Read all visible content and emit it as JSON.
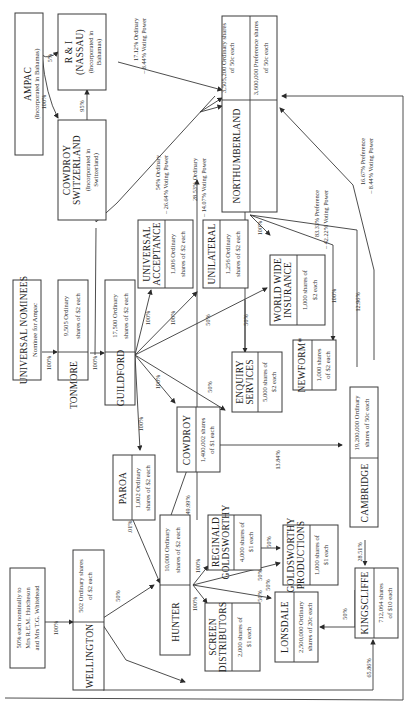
{
  "diagram": {
    "orientation": "rotated 90deg counter-clockwise (text reads bottom-to-top)",
    "entities": {
      "ampac": {
        "name": "AMPAC",
        "note": "(Incorporated in Bahamas)"
      },
      "ri_nassau": {
        "name": "R & I",
        "name2": "(NASSAU)",
        "note": "(Incorporated in",
        "note2": "Bahamas)"
      },
      "cowdroy_switzerland": {
        "name": "COWDROY",
        "name2": "SWITZERLAND",
        "note": "(Incorporated in",
        "note2": "Switzerland)"
      },
      "universal_nominees": {
        "name": "UNIVERSAL NOMINEES",
        "note": "Nominee for Ampac"
      },
      "tonmore": {
        "name": "TONMORE",
        "shares": "9,505 Ordinary",
        "shares2": "shares of $2 each"
      },
      "guildford": {
        "name": "GUILDFORD",
        "shares": "17,500 Ordinary",
        "shares2": "shares of $2 each"
      },
      "universal_acceptance": {
        "name": "UNIVERSAL",
        "name2": "ACCEPTANCE",
        "shares": "1,006 Ordinary",
        "shares2": "shares of $2 each"
      },
      "unilateral": {
        "name": "UNILATERAL",
        "shares": "1,256 Ordinary",
        "shares2": "shares of $2 each"
      },
      "northumberland": {
        "name": "NORTHUMBERLAND",
        "shares_ordinary": "3,505,200 Ordinary shares",
        "shares_ordinary2": "of 50c each",
        "shares_pref": "3,600,000 Preference shares",
        "shares_pref2": "of 50c each"
      },
      "world_wide_insurance": {
        "name": "WORLD WIDE",
        "name2": "INSURANCE",
        "shares": "1,000 shares of",
        "shares2": "$2 each"
      },
      "enquiry_services": {
        "name": "ENQUIRY",
        "name2": "SERVICES",
        "shares": "5,000 shares of",
        "shares2": "$2 each"
      },
      "newform": {
        "name": "NEWFORM*",
        "shares": "1,000 shares",
        "shares2": "of $2 each"
      },
      "cowdroy": {
        "name": "COWDROY",
        "shares": "1,400,002 shares",
        "shares2": "of $1 each"
      },
      "paroa": {
        "name": "PAROA",
        "shares": "1,002 Ordinary",
        "shares2": "shares of $2 each"
      },
      "cambridge": {
        "name": "CAMBRIDGE",
        "shares": "19,200,000 Ordinary",
        "shares2": "shares of 50c each"
      },
      "reginald_goldsworthy": {
        "name": "REGINALD",
        "name2": "GOLDSWORTHY",
        "shares": "4,000 shares of",
        "shares2": "$1 each"
      },
      "goldsworthy_productions": {
        "name": "GOLDSWORTHY",
        "name2": "PRODUCTIONS",
        "shares": "1,000 shares of",
        "shares2": "$1 each"
      },
      "hunter": {
        "name": "HUNTER",
        "shares": "10,000 Ordinary",
        "shares2": "shares of $2 each"
      },
      "screen_distributors": {
        "name": "SCREEN",
        "name2": "DISTRIBUTORS",
        "shares": "2,000 shares of",
        "shares2": "$1 each"
      },
      "lonsdale": {
        "name": "LONSDALE",
        "shares": "2,500,000 Ordinary",
        "shares2": "shares of 20c each"
      },
      "kingscliffe": {
        "name": "KINGSCLIFFE",
        "shares": "712,064 shares",
        "shares2": "of $10 each"
      },
      "wellington": {
        "name": "WELLINGTON",
        "shares": "502 Ordinary shares",
        "shares2": "of $2 each"
      },
      "owners": {
        "line1": "50% each nominally to",
        "line2": "Mrs R.E.M. Hutcheson",
        "line3": "and Mrs T.G. Whitehead"
      }
    },
    "relations": {
      "ampac_ri": "5%",
      "ampac_cowdroy_sw": "100%",
      "cowdroy_sw_ri": "95%",
      "ri_north_1": "17.12% Ordinary",
      "ri_north_2": "– 8.44% Voting Power",
      "cowdroy_sw_north_1": "54% Ordinary",
      "cowdroy_sw_north_2": "– 26.64% Voting Power",
      "unilateral_north_1": "28.53% Ordinary",
      "unilateral_north_2": "– 14.07% Voting Power",
      "cambridge_north_pref_1": "83.33% Preference",
      "cambridge_north_pref_2": "– 42.22% Voting Power",
      "kingscliffe_north_pref_1": "16.67% Preference",
      "kingscliffe_north_pref_2": "– 8.44% Voting Power",
      "universal_tonmore": "100%",
      "tonmore_guildford": "100%",
      "guildford_ua": "100%",
      "guildford_unilateral": "100%",
      "guildford_wwi": "50%",
      "guildford_enquiry": "50%",
      "guildford_cowdroy": "100%",
      "guildford_paroa": "100%",
      "unilateral_enquiry": "50%",
      "north_wwi": "100%",
      "north_newform": "100%",
      "north_cambridge": "12.96%",
      "cowdroy_cambridge": "13.84%",
      "cowdroy_hunter": "49.99%",
      "paroa_hunter": ".01%",
      "wellington_hunter": "50%",
      "owners_wellington": "100%",
      "hunter_reginald": "100%",
      "hunter_screen": "100%",
      "hunter_gp": "50%",
      "hunter_lonsdale": "50%",
      "reginald_gp": "50%",
      "screen_lonsdale": "50%",
      "cambridge_kingscliffe": "28.51%",
      "kingscliffe_lonsdale": "50%",
      "wellington_kingscliffe": "65.86%"
    }
  }
}
